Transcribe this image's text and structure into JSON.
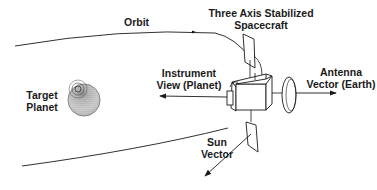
{
  "diagram": {
    "labels": {
      "orbit": "Orbit",
      "spacecraft_line1": "Three Axis Stabilized",
      "spacecraft_line2": "Spacecraft",
      "instrument_line1": "Instrument",
      "instrument_line2": "View (Planet)",
      "antenna_line1": "Antenna",
      "antenna_line2": "Vector (Earth)",
      "target_line1": "Target",
      "target_line2": "Planet",
      "sun_line1": "Sun",
      "sun_line2": "Vector"
    },
    "colors": {
      "line": "#1a1a1a",
      "background": "#ffffff"
    }
  }
}
